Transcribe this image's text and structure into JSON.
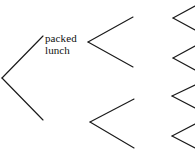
{
  "diagram": {
    "type": "binary-branching-tree",
    "background_color": "#ffffff",
    "line_color": "#1a1a1a",
    "line_width": 1.15,
    "canvas": {
      "width": 195,
      "height": 150
    },
    "labels": [
      {
        "id": "packed-lunch",
        "text": "packed lunch",
        "lines": [
          "packed",
          "lunch"
        ],
        "x": 45,
        "y": 33,
        "font_size": 11,
        "color": "#111111"
      }
    ],
    "branches": [
      {
        "id": "root-branch",
        "name": "root-branch",
        "vertex": {
          "x": 2,
          "y": 78
        },
        "upper_end": {
          "x": 43,
          "y": 36
        },
        "lower_end": {
          "x": 43,
          "y": 120
        }
      },
      {
        "id": "upper-branch",
        "name": "upper-branch",
        "vertex": {
          "x": 88,
          "y": 42
        },
        "upper_end": {
          "x": 133,
          "y": 17
        },
        "lower_end": {
          "x": 133,
          "y": 67
        }
      },
      {
        "id": "lower-branch",
        "name": "lower-branch",
        "vertex": {
          "x": 90,
          "y": 122
        },
        "upper_end": {
          "x": 134,
          "y": 99
        },
        "lower_end": {
          "x": 134,
          "y": 148
        }
      },
      {
        "id": "leaf-branch-1",
        "name": "leaf-branch-1",
        "vertex": {
          "x": 173,
          "y": 18
        },
        "upper_end": {
          "x": 195,
          "y": 6
        },
        "lower_end": {
          "x": 195,
          "y": 30
        }
      },
      {
        "id": "leaf-branch-2",
        "name": "leaf-branch-2",
        "vertex": {
          "x": 173,
          "y": 58
        },
        "upper_end": {
          "x": 195,
          "y": 46
        },
        "lower_end": {
          "x": 195,
          "y": 70
        }
      },
      {
        "id": "leaf-branch-3",
        "name": "leaf-branch-3",
        "vertex": {
          "x": 172,
          "y": 96
        },
        "upper_end": {
          "x": 195,
          "y": 85
        },
        "lower_end": {
          "x": 195,
          "y": 108
        }
      },
      {
        "id": "leaf-branch-4",
        "name": "leaf-branch-4",
        "vertex": {
          "x": 172,
          "y": 136
        },
        "upper_end": {
          "x": 195,
          "y": 124
        },
        "lower_end": {
          "x": 195,
          "y": 148
        }
      }
    ]
  }
}
